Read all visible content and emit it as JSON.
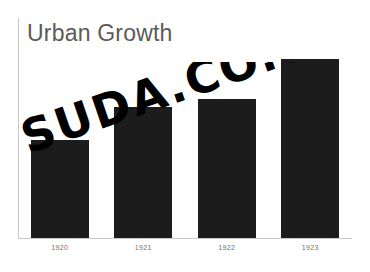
{
  "chart_data": {
    "type": "bar",
    "title": "Urban Growth",
    "xlabel": "",
    "ylabel": "",
    "categories": [
      "1920",
      "1921",
      "1922",
      "1923"
    ],
    "values": [
      98,
      131,
      139,
      179
    ],
    "ylim": [
      0,
      220
    ],
    "grid": false,
    "legend": "none",
    "series": [
      {
        "name": "Urban Growth",
        "values": [
          98,
          131,
          139,
          179
        ]
      }
    ],
    "annotations": [
      "SUDA.CO.UK"
    ]
  },
  "colors": {
    "bar": "#1c1c1c",
    "title": "#5a5a5a",
    "axis": "#c9c9c9",
    "tick_label": "#707070",
    "background": "#ffffff",
    "watermark": "#000000"
  },
  "watermark": {
    "text": "SUDA.CO.UK"
  }
}
